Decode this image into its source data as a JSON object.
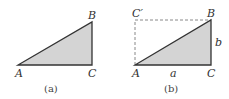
{
  "figure": {
    "panels": [
      {
        "caption": "(a)",
        "vertices": {
          "A": "A",
          "B": "B",
          "C": "C"
        },
        "fill_color": "#d4d4d4",
        "stroke_color": "#333333"
      },
      {
        "caption": "(b)",
        "vertices": {
          "A": "A",
          "B": "B",
          "C": "C",
          "C_prime": "C′"
        },
        "side_labels": {
          "bottom": "a",
          "right": "b"
        },
        "fill_color": "#d4d4d4",
        "stroke_color": "#333333",
        "dashed_color": "#888888"
      }
    ]
  }
}
